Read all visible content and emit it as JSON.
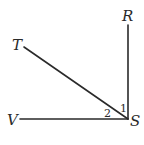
{
  "diagram": {
    "type": "geometry-angles",
    "vertex": "S",
    "points": {
      "R": {
        "label": "R",
        "x": 128,
        "y": 25
      },
      "T": {
        "label": "T",
        "x": 24,
        "y": 47
      },
      "V": {
        "label": "V",
        "x": 20,
        "y": 119
      },
      "S": {
        "label": "S",
        "x": 128,
        "y": 119
      }
    },
    "rays": [
      {
        "from": "S",
        "to": "R"
      },
      {
        "from": "S",
        "to": "T"
      },
      {
        "from": "S",
        "to": "V"
      }
    ],
    "angles": [
      {
        "label": "1",
        "between": [
          "R",
          "T"
        ]
      },
      {
        "label": "2",
        "between": [
          "T",
          "V"
        ]
      }
    ],
    "line_color": "#2a2a2a"
  }
}
